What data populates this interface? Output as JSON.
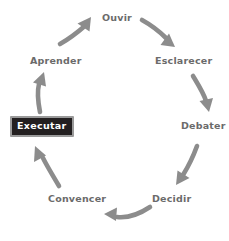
{
  "diagram": {
    "type": "cycle",
    "background_color": "#ffffff",
    "label_color": "#6b6b6b",
    "arrow_color": "#8c8c8c",
    "highlight_fill": "#231f20",
    "highlight_text_color": "#ffffff",
    "highlight_border_color": "#9a9a9a",
    "nodes": [
      {
        "id": "ouvir",
        "label": "Ouvir",
        "highlighted": false,
        "x": 118,
        "y": 18
      },
      {
        "id": "esclarecer",
        "label": "Esclarecer",
        "highlighted": false,
        "x": 183,
        "y": 61
      },
      {
        "id": "debater",
        "label": "Debater",
        "highlighted": false,
        "x": 202,
        "y": 126
      },
      {
        "id": "decidir",
        "label": "Decidir",
        "highlighted": false,
        "x": 171,
        "y": 199
      },
      {
        "id": "convencer",
        "label": "Convencer",
        "highlighted": false,
        "x": 77,
        "y": 199
      },
      {
        "id": "executar",
        "label": "Executar",
        "highlighted": true,
        "x": 41,
        "y": 125
      },
      {
        "id": "aprender",
        "label": "Aprender",
        "highlighted": false,
        "x": 56,
        "y": 61
      }
    ],
    "edges": [
      {
        "id": "ouvir-to-esclarecer",
        "from": "ouvir",
        "to": "esclarecer"
      },
      {
        "id": "esclarecer-to-debater",
        "from": "esclarecer",
        "to": "debater"
      },
      {
        "id": "debater-to-decidir",
        "from": "debater",
        "to": "decidir"
      },
      {
        "id": "decidir-to-convencer",
        "from": "decidir",
        "to": "convencer"
      },
      {
        "id": "convencer-to-executar",
        "from": "convencer",
        "to": "executar"
      },
      {
        "id": "executar-to-aprender",
        "from": "executar",
        "to": "aprender"
      },
      {
        "id": "aprender-to-ouvir",
        "from": "aprender",
        "to": "ouvir"
      }
    ]
  }
}
